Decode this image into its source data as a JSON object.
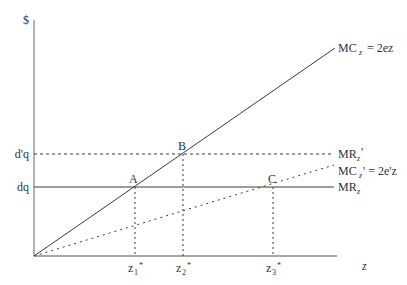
{
  "diagram": {
    "y_axis_label": "$",
    "x_axis_label": "z",
    "y_ticks": [
      {
        "label": "d'q",
        "y": 154
      },
      {
        "label": "dq",
        "y": 187
      }
    ],
    "x_ticks": [
      {
        "base": "z",
        "sub": "1",
        "sup": "*",
        "x": 135
      },
      {
        "base": "z",
        "sub": "2",
        "sup": "*",
        "x": 183
      },
      {
        "base": "z",
        "sub": "3",
        "sup": "*",
        "x": 273
      }
    ],
    "lines": [
      {
        "name": "MC_z",
        "label_main": "MC",
        "label_sub": "z",
        "label_rest": " = 2ez",
        "style": "solid",
        "from": [
          34,
          256
        ],
        "to": [
          335,
          48
        ]
      },
      {
        "name": "MR_z_prime",
        "label_main": "MR",
        "label_sub": "z",
        "label_rest": "'",
        "style": "dashed",
        "from": [
          34,
          154
        ],
        "to": [
          334,
          154
        ]
      },
      {
        "name": "MC_z_prime",
        "label_main": "MC",
        "label_sub": "z",
        "label_rest": "' = 2e'z",
        "style": "dotted",
        "from": [
          34,
          256
        ],
        "to": [
          334,
          165
        ]
      },
      {
        "name": "MR_z",
        "label_main": "MR",
        "label_sub": "z",
        "label_rest": "",
        "style": "solid",
        "from": [
          34,
          187
        ],
        "to": [
          334,
          187
        ]
      }
    ],
    "points": [
      {
        "label": "A",
        "x": 135,
        "y": 187
      },
      {
        "label": "B",
        "x": 183,
        "y": 154
      },
      {
        "label": "C",
        "x": 273,
        "y": 187
      }
    ],
    "colors": {
      "axis": "#8a8a8a",
      "line": "#3a3a3a",
      "text": "#333333"
    }
  }
}
